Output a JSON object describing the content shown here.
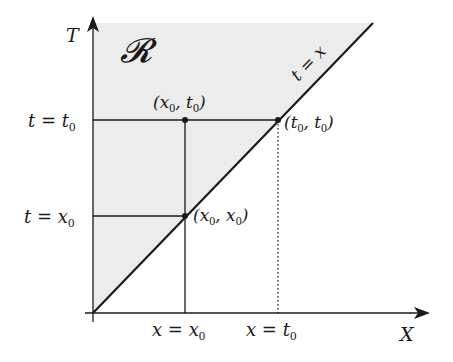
{
  "diagram": {
    "region_label": "𝓡",
    "axes": {
      "x_label": "X",
      "y_label": "T"
    },
    "diagonal_label": "t = x",
    "horizontal_lines": [
      {
        "label": "t = t",
        "sub": "0"
      },
      {
        "label": "t = x",
        "sub": "0"
      }
    ],
    "vertical_lines": [
      {
        "label": "x = x",
        "sub": "0",
        "style": "solid"
      },
      {
        "label": "x = t",
        "sub": "0",
        "style": "dotted"
      }
    ],
    "points": [
      {
        "name": "x0-t0",
        "label_parts": [
          "(x",
          "0",
          ", t",
          "0",
          ")"
        ]
      },
      {
        "name": "t0-t0",
        "label_parts": [
          "(t",
          "0",
          ", t",
          "0",
          ")"
        ]
      },
      {
        "name": "x0-x0",
        "label_parts": [
          "(x",
          "0",
          ", x",
          "0",
          ")"
        ]
      }
    ],
    "colors": {
      "shade": "#ececec",
      "line": "#1a1a1a"
    }
  }
}
